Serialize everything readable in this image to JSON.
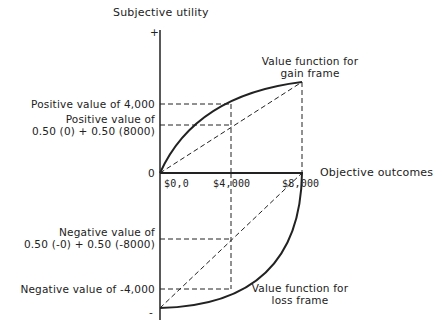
{
  "diagram": {
    "y_axis_label": "Subjective utility",
    "x_axis_label": "Objective outcomes",
    "y_plus": "+",
    "y_minus": "-",
    "origin_label": "0",
    "x_ticks": [
      "$0,0",
      "$4,000",
      "$8,000"
    ],
    "left_labels": {
      "pos_4000": "Positive value of 4,000",
      "pos_avg_line1": "Positive value of",
      "pos_avg_line2": "0.50 (0) + 0.50 (8000)",
      "neg_avg_line1": "Negative value of",
      "neg_avg_line2": "0.50 (-0) + 0.50 (-8000)",
      "neg_4000": "Negative value of -4,000"
    },
    "curve_labels": {
      "gain_line1": "Value function for",
      "gain_line2": "gain frame",
      "loss_line1": "Value function for",
      "loss_line2": "loss frame"
    },
    "colors": {
      "ink": "#222222",
      "background": "#ffffff"
    }
  }
}
